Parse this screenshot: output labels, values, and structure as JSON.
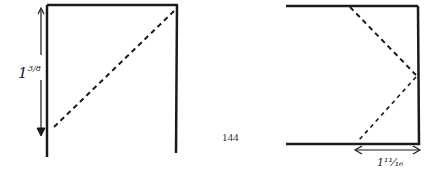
{
  "figure": {
    "page_number": "144",
    "left_diagram": {
      "dimension_label": "1⅜",
      "dimension_whole": "1",
      "dimension_fraction": "3/8",
      "fold_line": "diagonal dashed from bottom-left to top-right"
    },
    "right_diagram": {
      "dimension_label": "1¹¹⁄₁₆",
      "dimension_whole": "1",
      "dimension_fraction": "11/16",
      "fold_line": "dashed chevron pointing right"
    },
    "colors": {
      "ink": "#1a1a1a",
      "paper": "#ffffff"
    }
  }
}
